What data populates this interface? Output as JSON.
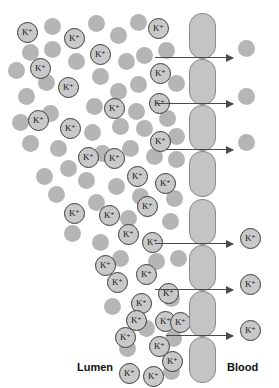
{
  "diagram": {
    "width": 279,
    "height": 388,
    "background_color": "#ffffff",
    "ion_symbol": "K⁺",
    "colors": {
      "particle_fill": "#b5b5b5",
      "ion_fill": "#c9c9c9",
      "ion_stroke": "#3a3a3a",
      "cell_fill": "#c4c4c4",
      "cell_stroke": "#8a8a8a",
      "arrow": "#4a4a4a",
      "label_text": "#111111"
    }
  },
  "labels": {
    "left": "Lumen",
    "right": "Blood"
  },
  "label_positions": {
    "left": {
      "x": 77,
      "y": 361
    },
    "right": {
      "x": 227,
      "y": 361
    }
  },
  "membrane": {
    "name": "epithelial-cell-column",
    "x": 189,
    "width": 27,
    "cell_height": 46,
    "corner_radius": 13,
    "cells": [
      {
        "y": 13
      },
      {
        "y": 59
      },
      {
        "y": 105
      },
      {
        "y": 151
      },
      {
        "y": 199
      },
      {
        "y": 245
      },
      {
        "y": 291
      },
      {
        "y": 337
      }
    ]
  },
  "arrows": [
    {
      "x": 155,
      "y": 57,
      "length": 78
    },
    {
      "x": 155,
      "y": 103,
      "length": 78
    },
    {
      "x": 166,
      "y": 149,
      "length": 67
    },
    {
      "x": 155,
      "y": 243,
      "length": 78
    },
    {
      "x": 155,
      "y": 289,
      "length": 78
    },
    {
      "x": 166,
      "y": 335,
      "length": 67
    }
  ],
  "ions": [
    {
      "x": 17,
      "y": 22,
      "d": 21
    },
    {
      "x": 64,
      "y": 28,
      "d": 21
    },
    {
      "x": 90,
      "y": 44,
      "d": 21
    },
    {
      "x": 30,
      "y": 58,
      "d": 21
    },
    {
      "x": 148,
      "y": 18,
      "d": 21
    },
    {
      "x": 150,
      "y": 63,
      "d": 21
    },
    {
      "x": 58,
      "y": 77,
      "d": 21
    },
    {
      "x": 104,
      "y": 98,
      "d": 21
    },
    {
      "x": 28,
      "y": 110,
      "d": 21
    },
    {
      "x": 60,
      "y": 118,
      "d": 21
    },
    {
      "x": 149,
      "y": 93,
      "d": 21
    },
    {
      "x": 78,
      "y": 147,
      "d": 21
    },
    {
      "x": 104,
      "y": 148,
      "d": 21
    },
    {
      "x": 150,
      "y": 131,
      "d": 21
    },
    {
      "x": 127,
      "y": 166,
      "d": 21
    },
    {
      "x": 155,
      "y": 173,
      "d": 21
    },
    {
      "x": 64,
      "y": 203,
      "d": 21
    },
    {
      "x": 99,
      "y": 205,
      "d": 21
    },
    {
      "x": 137,
      "y": 196,
      "d": 21
    },
    {
      "x": 118,
      "y": 224,
      "d": 21
    },
    {
      "x": 142,
      "y": 232,
      "d": 21
    },
    {
      "x": 95,
      "y": 255,
      "d": 21
    },
    {
      "x": 107,
      "y": 272,
      "d": 21
    },
    {
      "x": 136,
      "y": 264,
      "d": 21
    },
    {
      "x": 131,
      "y": 293,
      "d": 21
    },
    {
      "x": 158,
      "y": 283,
      "d": 21
    },
    {
      "x": 155,
      "y": 311,
      "d": 21
    },
    {
      "x": 126,
      "y": 310,
      "d": 21
    },
    {
      "x": 115,
      "y": 327,
      "d": 21
    },
    {
      "x": 149,
      "y": 336,
      "d": 21
    },
    {
      "x": 170,
      "y": 312,
      "d": 21
    },
    {
      "x": 162,
      "y": 351,
      "d": 21
    },
    {
      "x": 119,
      "y": 363,
      "d": 21
    },
    {
      "x": 143,
      "y": 366,
      "d": 21
    },
    {
      "x": 240,
      "y": 228,
      "d": 21
    },
    {
      "x": 240,
      "y": 274,
      "d": 21
    },
    {
      "x": 240,
      "y": 320,
      "d": 21
    }
  ],
  "particles": [
    {
      "x": 44,
      "y": 18,
      "d": 17
    },
    {
      "x": 88,
      "y": 15,
      "d": 17
    },
    {
      "x": 110,
      "y": 27,
      "d": 17
    },
    {
      "x": 130,
      "y": 14,
      "d": 17
    },
    {
      "x": 22,
      "y": 44,
      "d": 17
    },
    {
      "x": 44,
      "y": 41,
      "d": 17
    },
    {
      "x": 68,
      "y": 53,
      "d": 17
    },
    {
      "x": 92,
      "y": 68,
      "d": 17
    },
    {
      "x": 118,
      "y": 53,
      "d": 17
    },
    {
      "x": 136,
      "y": 47,
      "d": 17
    },
    {
      "x": 8,
      "y": 62,
      "d": 17
    },
    {
      "x": 38,
      "y": 74,
      "d": 17
    },
    {
      "x": 110,
      "y": 83,
      "d": 17
    },
    {
      "x": 130,
      "y": 76,
      "d": 17
    },
    {
      "x": 158,
      "y": 42,
      "d": 17
    },
    {
      "x": 168,
      "y": 75,
      "d": 17
    },
    {
      "x": 18,
      "y": 88,
      "d": 17
    },
    {
      "x": 86,
      "y": 98,
      "d": 17
    },
    {
      "x": 128,
      "y": 103,
      "d": 17
    },
    {
      "x": 159,
      "y": 110,
      "d": 17
    },
    {
      "x": 12,
      "y": 114,
      "d": 17
    },
    {
      "x": 42,
      "y": 105,
      "d": 17
    },
    {
      "x": 84,
      "y": 124,
      "d": 17
    },
    {
      "x": 112,
      "y": 118,
      "d": 17
    },
    {
      "x": 136,
      "y": 120,
      "d": 17
    },
    {
      "x": 168,
      "y": 128,
      "d": 17
    },
    {
      "x": 22,
      "y": 135,
      "d": 17
    },
    {
      "x": 50,
      "y": 140,
      "d": 17
    },
    {
      "x": 94,
      "y": 145,
      "d": 17
    },
    {
      "x": 122,
      "y": 140,
      "d": 17
    },
    {
      "x": 146,
      "y": 148,
      "d": 17
    },
    {
      "x": 168,
      "y": 151,
      "d": 17
    },
    {
      "x": 60,
      "y": 160,
      "d": 17
    },
    {
      "x": 36,
      "y": 168,
      "d": 17
    },
    {
      "x": 78,
      "y": 172,
      "d": 17
    },
    {
      "x": 108,
      "y": 178,
      "d": 17
    },
    {
      "x": 132,
      "y": 188,
      "d": 17
    },
    {
      "x": 166,
      "y": 190,
      "d": 17
    },
    {
      "x": 48,
      "y": 186,
      "d": 17
    },
    {
      "x": 88,
      "y": 194,
      "d": 17
    },
    {
      "x": 120,
      "y": 210,
      "d": 17
    },
    {
      "x": 162,
      "y": 213,
      "d": 17
    },
    {
      "x": 64,
      "y": 225,
      "d": 17
    },
    {
      "x": 92,
      "y": 234,
      "d": 17
    },
    {
      "x": 148,
      "y": 253,
      "d": 17
    },
    {
      "x": 170,
      "y": 250,
      "d": 17
    },
    {
      "x": 112,
      "y": 250,
      "d": 17
    },
    {
      "x": 163,
      "y": 290,
      "d": 17
    },
    {
      "x": 104,
      "y": 298,
      "d": 17
    },
    {
      "x": 138,
      "y": 320,
      "d": 17
    },
    {
      "x": 165,
      "y": 330,
      "d": 17
    },
    {
      "x": 119,
      "y": 340,
      "d": 17
    },
    {
      "x": 163,
      "y": 363,
      "d": 17
    },
    {
      "x": 238,
      "y": 40,
      "d": 17
    },
    {
      "x": 238,
      "y": 88,
      "d": 17
    },
    {
      "x": 238,
      "y": 134,
      "d": 17
    }
  ]
}
